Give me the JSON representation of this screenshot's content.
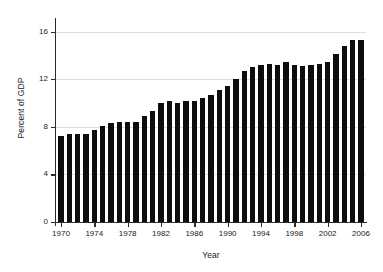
{
  "chart_data": {
    "type": "bar",
    "title": "",
    "subtitle": "",
    "xlabel": "Year",
    "ylabel": "Percent of GDP",
    "xlim": [
      1969.4,
      2006.6
    ],
    "ylim": [
      0,
      16.8
    ],
    "grid": true,
    "legend": false,
    "legend_position": "none",
    "bar_color": "#0d0d0d",
    "grid_color": "#dedede",
    "axis_color": "#2b2b2b",
    "y_ticks": [
      0,
      4,
      8,
      12,
      16
    ],
    "y_tick_labels": [
      "0",
      "4",
      "8",
      "12",
      "16"
    ],
    "x_ticks": [
      1970,
      1974,
      1978,
      1982,
      1986,
      1990,
      1994,
      1998,
      2002,
      2006
    ],
    "x_tick_labels": [
      "1970",
      "1974",
      "1978",
      "1982",
      "1986",
      "1990",
      "1994",
      "1998",
      "2002",
      "2006"
    ],
    "categories": [
      "1970",
      "1971",
      "1972",
      "1973",
      "1974",
      "1975",
      "1976",
      "1977",
      "1978",
      "1979",
      "1980",
      "1981",
      "1982",
      "1983",
      "1984",
      "1985",
      "1986",
      "1987",
      "1988",
      "1989",
      "1990",
      "1991",
      "1992",
      "1993",
      "1994",
      "1995",
      "1996",
      "1997",
      "1998",
      "1999",
      "2000",
      "2001",
      "2002",
      "2003",
      "2004",
      "2005",
      "2006"
    ],
    "values": [
      7.2,
      7.4,
      7.4,
      7.4,
      7.7,
      8.1,
      8.3,
      8.4,
      8.4,
      8.4,
      8.9,
      9.3,
      10.0,
      10.2,
      10.0,
      10.2,
      10.2,
      10.4,
      10.7,
      11.1,
      11.4,
      12.0,
      12.7,
      13.0,
      13.2,
      13.3,
      13.2,
      13.4,
      13.2,
      13.1,
      13.2,
      13.3,
      13.4,
      14.1,
      14.8,
      15.3,
      15.3
    ]
  }
}
